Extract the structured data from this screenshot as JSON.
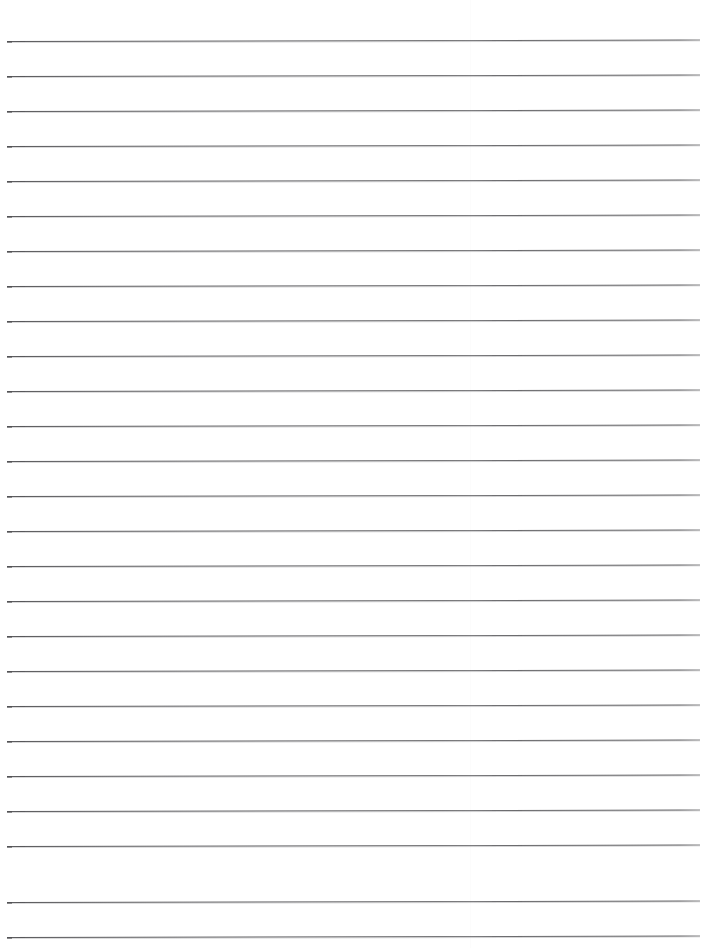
{
  "document": {
    "kind": "scanned-lined-paper",
    "title": "Blank ruled notebook page",
    "content_text": "",
    "page_width": 706,
    "page_height": 948,
    "background_color": "#ffffff",
    "rule_color": "#54545a",
    "rule_halo_color": "#929295",
    "rule_thickness_px": 1,
    "rule_left_x": 7,
    "rule_right_x": 700,
    "rule_length_px": 693,
    "first_rule_y": 41,
    "rule_spacing_px": 35,
    "rule_count": 26,
    "skew_degrees": -0.12,
    "scan_seam_x": 470,
    "top_margin_px": 41,
    "bottom_margin_px": 11,
    "rules": [
      {
        "index": 1,
        "y": 41
      },
      {
        "index": 2,
        "y": 76
      },
      {
        "index": 3,
        "y": 111
      },
      {
        "index": 4,
        "y": 146
      },
      {
        "index": 5,
        "y": 181
      },
      {
        "index": 6,
        "y": 216
      },
      {
        "index": 7,
        "y": 251
      },
      {
        "index": 8,
        "y": 286
      },
      {
        "index": 9,
        "y": 321
      },
      {
        "index": 10,
        "y": 356
      },
      {
        "index": 11,
        "y": 391
      },
      {
        "index": 12,
        "y": 426
      },
      {
        "index": 13,
        "y": 461
      },
      {
        "index": 14,
        "y": 496
      },
      {
        "index": 15,
        "y": 531
      },
      {
        "index": 16,
        "y": 566
      },
      {
        "index": 17,
        "y": 601
      },
      {
        "index": 18,
        "y": 636
      },
      {
        "index": 19,
        "y": 671
      },
      {
        "index": 20,
        "y": 706
      },
      {
        "index": 21,
        "y": 741
      },
      {
        "index": 22,
        "y": 776
      },
      {
        "index": 23,
        "y": 811
      },
      {
        "index": 24,
        "y": 846
      },
      {
        "index": 25,
        "y": 902
      },
      {
        "index": 26,
        "y": 937
      }
    ]
  }
}
